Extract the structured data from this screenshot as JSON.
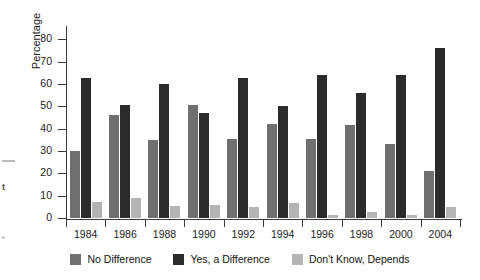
{
  "chart_data": {
    "type": "bar",
    "title": "",
    "xlabel": "",
    "ylabel": "Percentage",
    "ylim": [
      0,
      85
    ],
    "yticks": [
      0,
      10,
      20,
      30,
      40,
      50,
      60,
      70,
      80
    ],
    "grid": false,
    "legend_position": "bottom",
    "categories": [
      "1984",
      "1986",
      "1988",
      "1990",
      "1992",
      "1994",
      "1996",
      "1998",
      "2000",
      "2004"
    ],
    "series": [
      {
        "name": "No Difference",
        "color": "#6f6f6f",
        "values": [
          30,
          46,
          35,
          50.5,
          35.5,
          42,
          35.5,
          41.5,
          33,
          21
        ]
      },
      {
        "name": "Yes, a Difference",
        "color": "#2b2b2b",
        "values": [
          62.5,
          50.5,
          60,
          47,
          62.5,
          50,
          64,
          56,
          64,
          76
        ]
      },
      {
        "name": "Don't Know, Depends",
        "color": "#b4b4b4",
        "values": [
          7,
          9,
          5.5,
          6,
          5,
          6.5,
          1.5,
          2.5,
          1.5,
          5
        ]
      }
    ]
  },
  "page_bleed": {
    "glyph_bold": "t",
    "glyph_small": "e"
  }
}
